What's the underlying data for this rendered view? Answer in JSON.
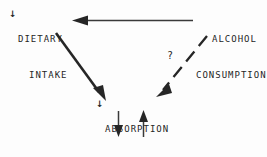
{
  "diagram": {
    "background_color": "#fdfdfd",
    "ink_color": "#262626",
    "nodes": [
      {
        "id": "dietary-intake",
        "line1": "DIETARY",
        "line2": "INTAKE",
        "decrease_marker": "↓"
      },
      {
        "id": "alcohol-consumption",
        "line1": "ALCOHOL",
        "line2": "CONSUMPTION",
        "decrease_marker": ""
      },
      {
        "id": "absorption",
        "line1": "ABSORPTION",
        "line2": "",
        "decrease_marker": "↓"
      },
      {
        "id": "deficiency-state",
        "line1": "DEFICIENCY STATE",
        "line2": "",
        "decrease_marker": ""
      }
    ],
    "edges": [
      {
        "id": "alcohol-to-dietary",
        "from": "alcohol-consumption",
        "to": "dietary-intake",
        "style": "solid",
        "direction": "left",
        "label": ""
      },
      {
        "id": "dietary-to-absorption",
        "from": "dietary-intake",
        "to": "absorption",
        "style": "solid",
        "direction": "down-right",
        "label": ""
      },
      {
        "id": "alcohol-to-absorption",
        "from": "alcohol-consumption",
        "to": "absorption",
        "style": "dashed",
        "direction": "down-left",
        "label": "?"
      },
      {
        "id": "absorption-to-deficiency",
        "from": "absorption",
        "to": "deficiency-state",
        "style": "solid",
        "direction": "down",
        "label": ""
      },
      {
        "id": "deficiency-to-absorption",
        "from": "deficiency-state",
        "to": "absorption",
        "style": "solid",
        "direction": "up",
        "label": ""
      }
    ],
    "uncertain_label": "?"
  }
}
